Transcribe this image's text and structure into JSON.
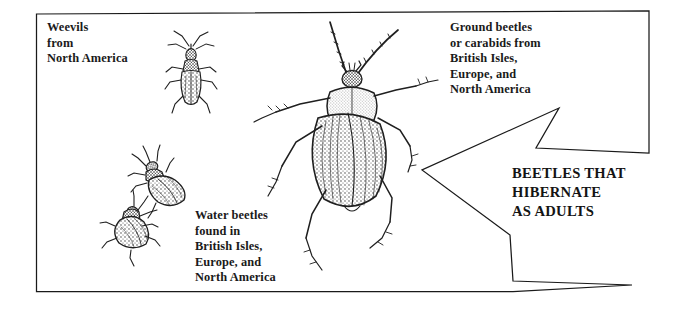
{
  "figure": {
    "title": "Beetles that hibernate as adults",
    "background_color": "#ffffff",
    "ink_color": "#1a1a1a",
    "width": 691,
    "height": 309
  },
  "captions": {
    "weevils": "Weevils\nfrom\nNorth America",
    "ground_beetles": "Ground beetles\nor carabids from\nBritish Isles,\nEurope, and\nNorth America",
    "water_beetles": "Water beetles\nfound in\nBritish Isles,\nEurope, and\nNorth America"
  },
  "arrow": {
    "label": "BEETLES THAT\nHIBERNATE\nAS ADULTS",
    "direction": "left",
    "outline_color": "#1a1a1a"
  },
  "illustrations": [
    {
      "name": "weevil",
      "description": "Weevil beetle, dorsal view"
    },
    {
      "name": "ground-beetle",
      "description": "Large ground beetle or carabid, dorsal view with long antennae"
    },
    {
      "name": "water-beetle-upper",
      "description": "Water beetle, oval body, dorsal view"
    },
    {
      "name": "water-beetle-lower",
      "description": "Water beetle, oval body, dorsal view"
    }
  ]
}
